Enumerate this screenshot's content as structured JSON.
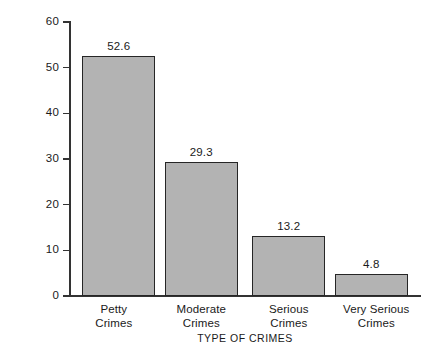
{
  "chart_data": {
    "type": "bar",
    "title": "",
    "xlabel": "TYPE OF CRIMES",
    "ylabel": "PERCENT OF NEW ADMISSIONS",
    "categories": [
      "Petty Crimes",
      "Moderate Crimes",
      "Serious Crimes",
      "Very Serious Crimes"
    ],
    "category_lines": [
      [
        "Petty",
        "Crimes"
      ],
      [
        "Moderate",
        "Crimes"
      ],
      [
        "Serious",
        "Crimes"
      ],
      [
        "Very Serious",
        "Crimes"
      ]
    ],
    "values": [
      52.6,
      29.3,
      13.2,
      4.8
    ],
    "value_labels": [
      "52.6",
      "29.3",
      "13.2",
      "4.8"
    ],
    "ylim": [
      0,
      60
    ],
    "ytick_values": [
      0,
      10,
      20,
      30,
      40,
      50,
      60
    ],
    "ytick_labels": [
      "0",
      "10",
      "20",
      "30",
      "40",
      "50",
      "60"
    ],
    "grid": false,
    "legend": false,
    "bar_fill_color": "#b3b3b3",
    "bar_edge_color": "#262626",
    "axis_color": "#333333",
    "background_color": "#ffffff"
  },
  "axes": {
    "y_title": "PERCENT OF NEW ADMISSIONS",
    "x_title": "TYPE OF CRIMES"
  },
  "ticks": {
    "y": [
      {
        "label": "60",
        "value": 60
      },
      {
        "label": "50",
        "value": 50
      },
      {
        "label": "40",
        "value": 40
      },
      {
        "label": "30",
        "value": 30
      },
      {
        "label": "20",
        "value": 20
      },
      {
        "label": "10",
        "value": 10
      },
      {
        "label": "0",
        "value": 0
      }
    ]
  },
  "bars": [
    {
      "label_line1": "Petty",
      "label_line2": "Crimes",
      "value_label": "52.6",
      "value": 52.6
    },
    {
      "label_line1": "Moderate",
      "label_line2": "Crimes",
      "value_label": "29.3",
      "value": 29.3
    },
    {
      "label_line1": "Serious",
      "label_line2": "Crimes",
      "value_label": "13.2",
      "value": 13.2
    },
    {
      "label_line1": "Very Serious",
      "label_line2": "Crimes",
      "value_label": "4.8",
      "value": 4.8
    }
  ]
}
